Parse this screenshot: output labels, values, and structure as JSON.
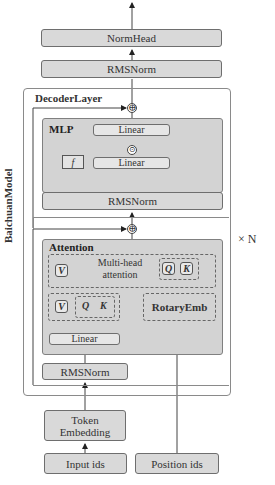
{
  "model": {
    "label": "BaichuanModel",
    "repeat": "× N"
  },
  "head": {
    "normhead": "NormHead",
    "final_norm": "RMSNorm"
  },
  "decoder": {
    "label": "DecoderLayer",
    "mlp": {
      "title": "MLP",
      "linear_out": "Linear",
      "linear_in": "Linear",
      "activation": "f",
      "gate_op": "⊙"
    },
    "post_attn_norm": "RMSNorm",
    "attention": {
      "title": "Attention",
      "multihead_line1": "Multi-head",
      "multihead_line2": "attention",
      "v_top": "V",
      "q_top": "Q",
      "k_top": "K",
      "v_bottom": "V",
      "q_bottom": "Q",
      "k_bottom": "K",
      "rotary": "RotaryEmb",
      "linear": "Linear"
    },
    "input_norm": "RMSNorm",
    "residual_op": "⊕"
  },
  "inputs": {
    "token_embedding_line1": "Token",
    "token_embedding_line2": "Embedding",
    "input_ids": "Input ids",
    "position_ids": "Position ids"
  }
}
